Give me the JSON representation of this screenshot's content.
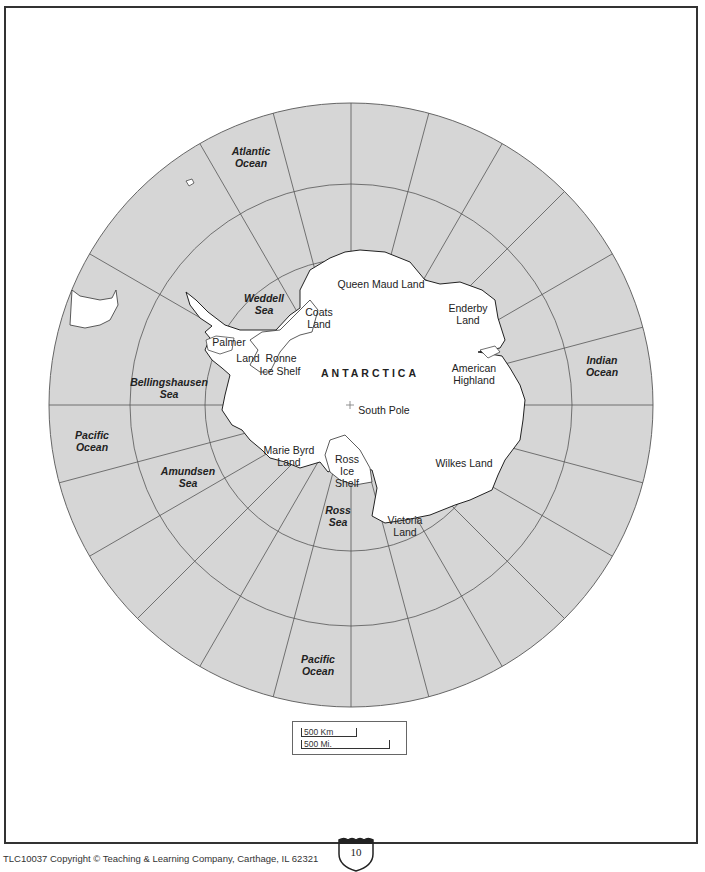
{
  "map": {
    "title": "ANTARCTICA",
    "south_pole_label": "South Pole",
    "ocean_color": "#d6d6d6",
    "land_color": "#ffffff",
    "grid_color": "#555555",
    "oceans": [
      {
        "name": "Atlantic",
        "line2": "Ocean",
        "label": "Atlantic Ocean"
      },
      {
        "name": "Indian",
        "line2": "Ocean",
        "label": "Indian Ocean"
      },
      {
        "name": "Pacific",
        "line2": "Ocean",
        "label": "Pacific Ocean"
      },
      {
        "name": "Pacific",
        "line2": "Ocean",
        "label": "Pacific Ocean"
      }
    ],
    "seas": [
      {
        "line1": "Weddell",
        "line2": "Sea"
      },
      {
        "line1": "Bellingshausen",
        "line2": "Sea"
      },
      {
        "line1": "Amundsen",
        "line2": "Sea"
      },
      {
        "line1": "Ross",
        "line2": "Sea"
      }
    ],
    "regions": [
      {
        "line1": "Queen Maud Land",
        "line2": ""
      },
      {
        "line1": "Enderby",
        "line2": "Land"
      },
      {
        "line1": "American",
        "line2": "Highland"
      },
      {
        "line1": "Wilkes Land",
        "line2": ""
      },
      {
        "line1": "Victoria",
        "line2": "Land"
      },
      {
        "line1": "Ross",
        "line2": "Ice",
        "line3": "Shelf"
      },
      {
        "line1": "Marie Byrd",
        "line2": "Land"
      },
      {
        "line1": "Coats",
        "line2": "Land"
      },
      {
        "line1": "Palmer",
        "line2": "Land"
      },
      {
        "line1": "Ronne",
        "line2": "Ice Shelf"
      }
    ]
  },
  "scale": {
    "km_label": "500 Km",
    "mi_label": "500 Mi."
  },
  "footer": {
    "copyright": "TLC10037 Copyright © Teaching & Learning Company, Carthage, IL  62321",
    "page_number": "10"
  }
}
